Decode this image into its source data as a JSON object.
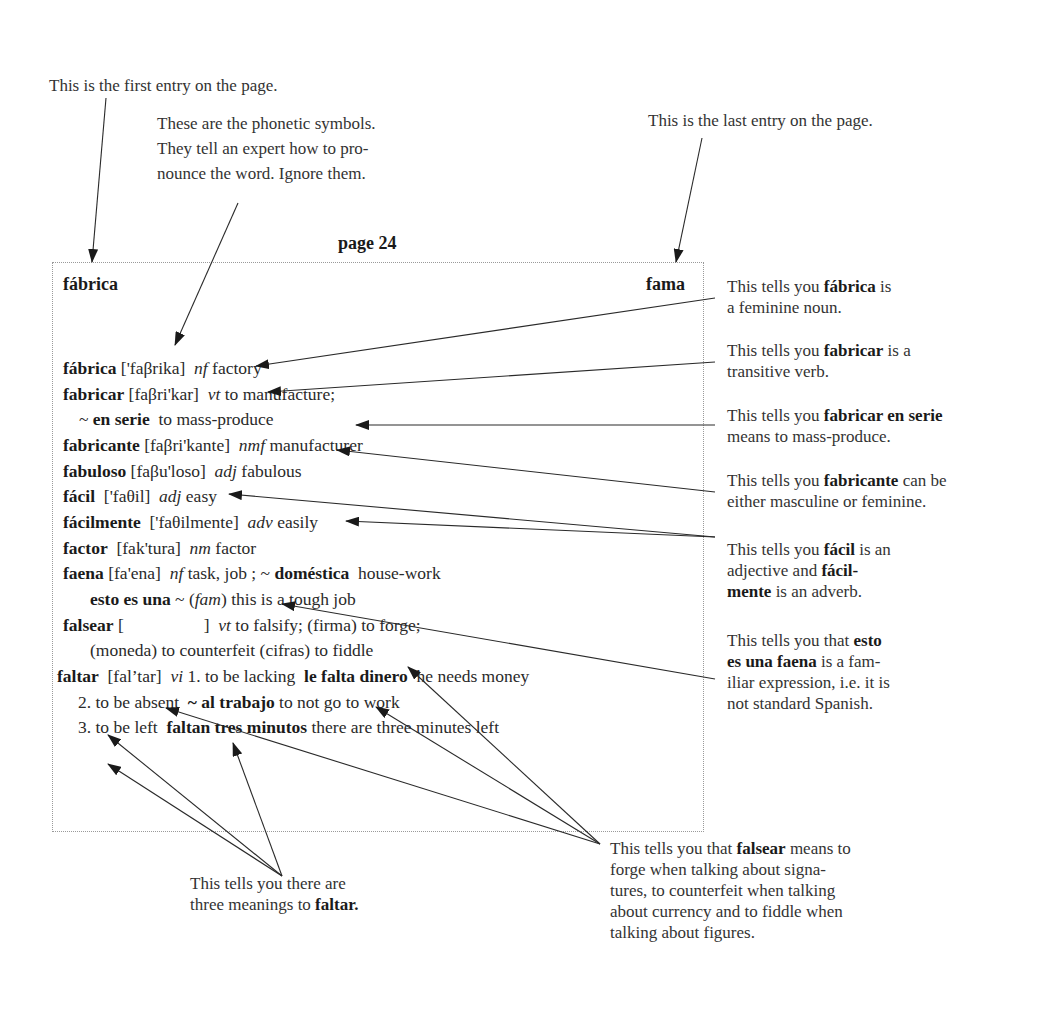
{
  "top_notes": {
    "first_entry": "This is the first entry on the page.",
    "phonetic": [
      "These are the phonetic symbols.",
      "They tell an expert how to pro-",
      "nounce the word. Ignore them."
    ],
    "last_entry": "This is the last entry on the page."
  },
  "page": {
    "label": "page 24",
    "guide_first": "fábrica",
    "guide_last": "fama"
  },
  "entries": [
    {
      "head": "fábrica",
      "phon": "['faβrika]",
      "pos": "nf",
      "def": "factory"
    },
    {
      "head": "fabricar",
      "phon": "[faβri'kar]",
      "pos": "vt",
      "def": "to manufacture;"
    },
    {
      "indent": true,
      "tilde": "~",
      "phrase": "en serie",
      "def": "to mass-produce"
    },
    {
      "head": "fabricante",
      "phon": "[faβri'kante]",
      "pos": "nmf",
      "def": "manufacturer"
    },
    {
      "head": "fabuloso",
      "phon": "[faβu'loso]",
      "pos": "adj",
      "def": "fabulous"
    },
    {
      "head": "fácil",
      "phon": "['faθil]",
      "pos": "adj",
      "def": "easy"
    },
    {
      "head": "fácilmente",
      "phon": "['faθilmente]",
      "pos": "adv",
      "def": "easily"
    },
    {
      "head": "factor",
      "phon": "[fak'tura]",
      "pos": "nm",
      "def": "factor"
    },
    {
      "head": "faena",
      "phon": "[fa'ena]",
      "pos": "nf",
      "def": "task, job ;",
      "tilde": "~",
      "phrase": "doméstica",
      "def2": "house-work"
    },
    {
      "indent": true,
      "phrase": "esto es una",
      "tilde": "~",
      "label": "fam",
      "def": "this is a tough job"
    },
    {
      "head": "falsear",
      "phon_open": "[",
      "phon_close": "]",
      "pos": "vt",
      "def": "to falsify; (firma) to forge;"
    },
    {
      "indent": true,
      "def": "(moneda) to counterfeit (cifras) to fiddle"
    },
    {
      "head": "faltar",
      "phon": "[fal’tar]",
      "pos": "vi",
      "def": "1. to be lacking",
      "phrase": "le falta dinero",
      "def2": "he needs money"
    },
    {
      "indent": true,
      "def": "2. to be absent",
      "tilde": "~",
      "phrase": "al trabajo",
      "def2": "to not go to work"
    },
    {
      "indent": true,
      "def": "3. to be left",
      "phrase": "faltan tres minutos",
      "def2": "there are three minutes left"
    }
  ],
  "side_notes": [
    {
      "pre": "This tells you ",
      "bold": "fábrica",
      "post": " is",
      "line2": "a feminine noun."
    },
    {
      "pre": "This tells you ",
      "bold": "fabricar",
      "post": " is a",
      "line2": "transitive verb."
    },
    {
      "pre": "This tells you ",
      "bold": "fabricar en serie",
      "post": "",
      "line2": "means to mass-produce."
    },
    {
      "pre": "This tells you ",
      "bold": "fabricante",
      "post": " can be",
      "line2": "either masculine or feminine."
    },
    {
      "pre": "This tells you ",
      "bold": "fácil",
      "post": " is an",
      "line2_pre": "adjective and ",
      "line2_bold": "fácil-",
      "line3_bold": "mente",
      "line3_post": " is an adverb."
    },
    {
      "pre": "This tells you that ",
      "bold": "esto",
      "line2_bold": "es una faena",
      "line2_post": " is a fam-",
      "line3": "iliar expression, i.e. it is",
      "line4": "not standard Spanish."
    }
  ],
  "bottom_notes": {
    "faltar": {
      "line1": "This tells you there are",
      "line2_pre": "three meanings to ",
      "line2_bold": "faltar."
    },
    "falsear": {
      "pre": "This tells you that ",
      "bold": "falsear",
      "post": " means to",
      "line2": "forge when talking about signa-",
      "line3": "tures, to counterfeit when talking",
      "line4": "about currency and to fiddle when",
      "line5": "talking about figures."
    }
  }
}
